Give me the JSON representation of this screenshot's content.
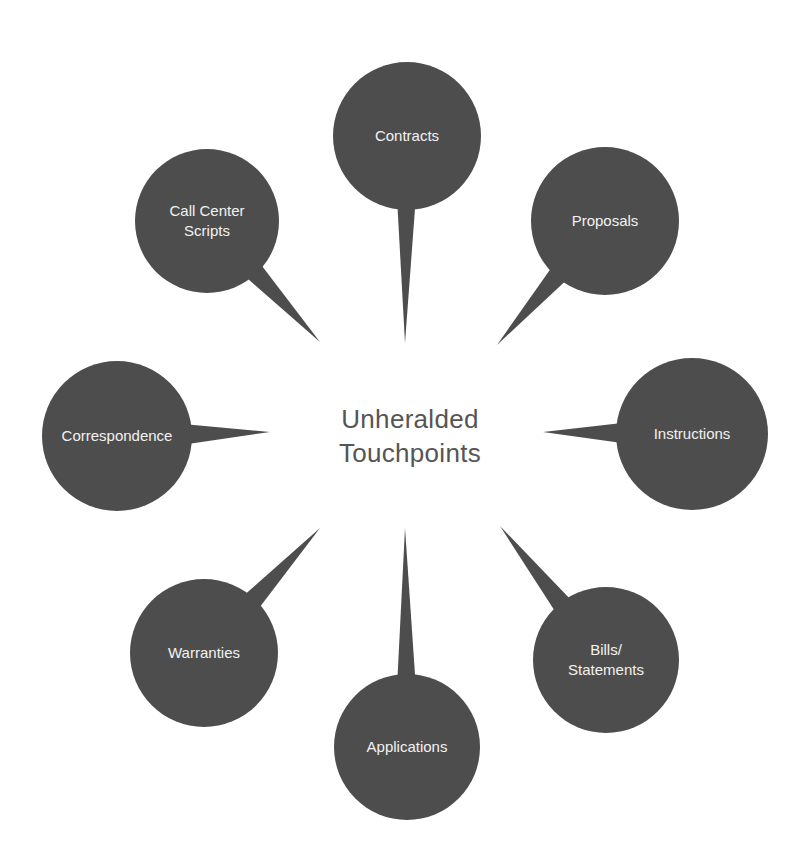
{
  "diagram": {
    "center": {
      "label": "Unheralded\nTouchpoints"
    },
    "colors": {
      "bubble": "#4d4d4d",
      "bubble_text": "#f2f2f2",
      "center_text": "#555555",
      "background": "#ffffff"
    },
    "nodes": [
      {
        "id": "contracts",
        "label": "Contracts",
        "cx": 407,
        "cy": 136,
        "r": 74,
        "tip": [
          405,
          343
        ],
        "base_half": 9
      },
      {
        "id": "proposals",
        "label": "Proposals",
        "cx": 605,
        "cy": 221,
        "r": 74,
        "tip": [
          497,
          345
        ],
        "base_half": 10
      },
      {
        "id": "instructions",
        "label": "Instructions",
        "cx": 692,
        "cy": 434,
        "r": 76,
        "tip": [
          543,
          432
        ],
        "base_half": 10
      },
      {
        "id": "bills-statements",
        "label": "Bills/\nStatements",
        "cx": 606,
        "cy": 660,
        "r": 73,
        "tip": [
          500,
          526
        ],
        "base_half": 10
      },
      {
        "id": "applications",
        "label": "Applications",
        "cx": 407,
        "cy": 747,
        "r": 73,
        "tip": [
          405,
          528
        ],
        "base_half": 9
      },
      {
        "id": "warranties",
        "label": "Warranties",
        "cx": 204,
        "cy": 653,
        "r": 74,
        "tip": [
          320,
          528
        ],
        "base_half": 10
      },
      {
        "id": "correspondence",
        "label": "Correspondence",
        "cx": 117,
        "cy": 436,
        "r": 75,
        "tip": [
          270,
          432
        ],
        "base_half": 10
      },
      {
        "id": "call-center-scripts",
        "label": "Call Center\nScripts",
        "cx": 207,
        "cy": 221,
        "r": 72,
        "tip": [
          320,
          342
        ],
        "base_half": 10
      }
    ]
  }
}
